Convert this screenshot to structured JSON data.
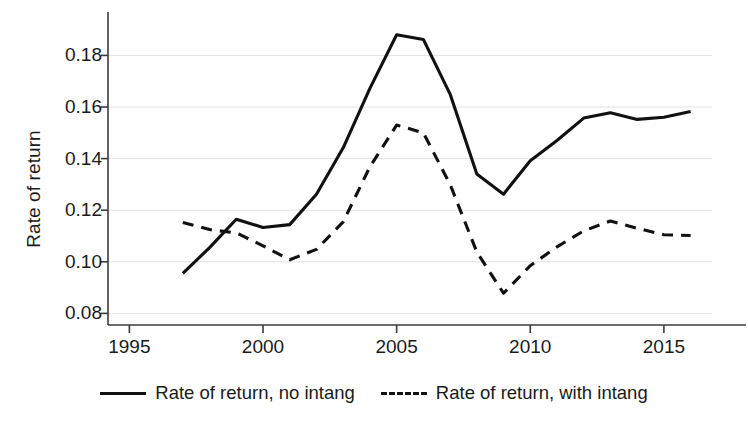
{
  "chart_data": {
    "type": "line",
    "title": "",
    "xlabel": "",
    "ylabel": "Rate of return",
    "xlim": [
      1994.2,
      2016.8
    ],
    "ylim": [
      0.0755,
      0.1945
    ],
    "grid": true,
    "grid_axis": "y",
    "legend_position": "bottom-center",
    "xticks": [
      1995,
      2000,
      2005,
      2010,
      2015
    ],
    "xtick_labels": [
      "1995",
      "2000",
      "2005",
      "2010",
      "2015"
    ],
    "yticks": [
      0.08,
      0.1,
      0.12,
      0.14,
      0.16,
      0.18
    ],
    "ytick_labels": [
      "0.08",
      "0.10",
      "0.12",
      "0.14",
      "0.16",
      "0.18"
    ],
    "x": [
      1997,
      1998,
      1999,
      2000,
      2001,
      2002,
      2003,
      2004,
      2005,
      2006,
      2007,
      2008,
      2009,
      2010,
      2011,
      2012,
      2013,
      2014,
      2015,
      2016
    ],
    "series": [
      {
        "name": "Rate of return, no intang",
        "style": "solid",
        "color": "#111111",
        "values": [
          0.0955,
          0.1055,
          0.1165,
          0.1133,
          0.1144,
          0.1262,
          0.1442,
          0.1672,
          0.188,
          0.1862,
          0.165,
          0.134,
          0.1262,
          0.1392,
          0.147,
          0.1557,
          0.1578,
          0.1552,
          0.156,
          0.1583
        ]
      },
      {
        "name": "Rate of return, with intang",
        "style": "dashed",
        "color": "#111111",
        "values": [
          0.1152,
          0.1125,
          0.1112,
          0.1062,
          0.1008,
          0.1048,
          0.1155,
          0.1368,
          0.153,
          0.15,
          0.13,
          0.1038,
          0.0878,
          0.0985,
          0.1058,
          0.112,
          0.1158,
          0.113,
          0.1105,
          0.1102
        ]
      }
    ]
  },
  "axis": {
    "y_title": "Rate of return"
  },
  "legend": {
    "items": [
      {
        "label": "Rate of return, no intang",
        "style": "solid"
      },
      {
        "label": "Rate of return, with intang",
        "style": "dashed"
      }
    ]
  },
  "colors": {
    "line": "#111111",
    "grid": "#e2e2e2",
    "axis": "#3b3b3b",
    "text": "#1a1a1a",
    "background": "#ffffff"
  }
}
